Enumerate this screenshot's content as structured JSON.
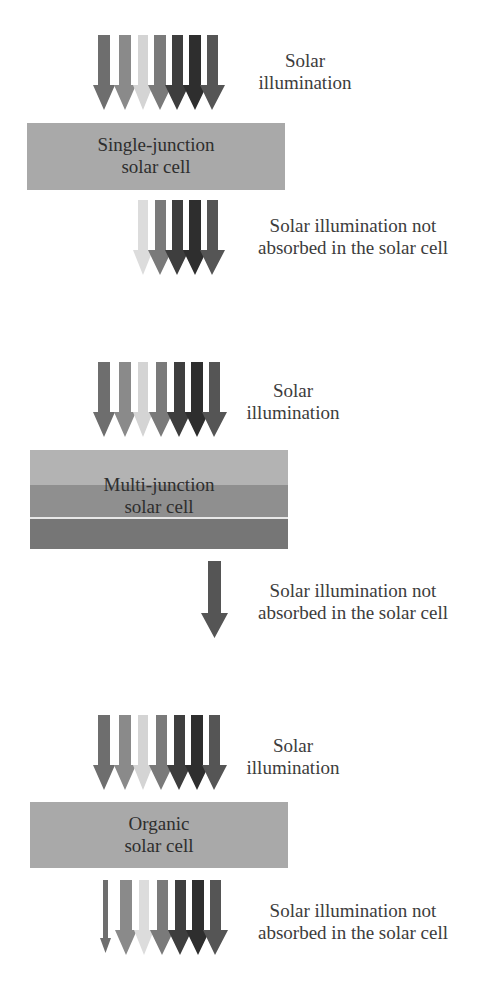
{
  "colors": {
    "arrow_1": "#6e6e6e",
    "arrow_2": "#8a8a8a",
    "arrow_3": "#d4d4d4",
    "arrow_4": "#7a7a7a",
    "arrow_5": "#3e3e3e",
    "arrow_6": "#2e2e2e",
    "arrow_7": "#555555",
    "cell_single": "#a9a9a9",
    "cell_organic": "#a9a9a9",
    "mj_layer_top": "#b3b3b3",
    "mj_layer_mid": "#8f8f8f",
    "mj_layer_bottom": "#767676"
  },
  "sections": [
    {
      "id": "single-junction",
      "incoming_label": [
        "Solar",
        "illumination"
      ],
      "cell_label": [
        "Single-junction",
        "solar cell"
      ],
      "outgoing_label": [
        "Solar illumination not",
        "absorbed in the solar cell"
      ]
    },
    {
      "id": "multi-junction",
      "incoming_label": [
        "Solar",
        "illumination"
      ],
      "cell_label": [
        "Multi-junction",
        "solar cell"
      ],
      "outgoing_label": [
        "Solar illumination not",
        "absorbed in the solar cell"
      ]
    },
    {
      "id": "organic",
      "incoming_label": [
        "Solar",
        "illumination"
      ],
      "cell_label": [
        "Organic",
        "solar cell"
      ],
      "outgoing_label": [
        "Solar illumination not",
        "absorbed in the solar cell"
      ]
    }
  ]
}
